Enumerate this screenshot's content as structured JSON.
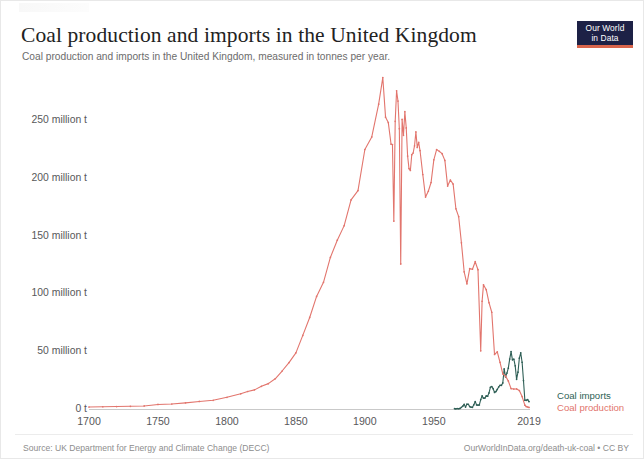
{
  "header": {
    "title": "Coal production and imports in the United Kingdom",
    "subtitle": "Coal production and imports in the United Kingdom, measured in tonnes per year.",
    "logo_line1": "Our World",
    "logo_line2": "in Data"
  },
  "footer": {
    "source": "Source: UK Department for Energy and Climate Change (DECC)",
    "attribution": "OurWorldInData.org/death-uk-coal • CC BY"
  },
  "colors": {
    "production": "#e2756d",
    "imports": "#2f5f56",
    "axis_text": "#58585a",
    "baseline": "#c9c9c9",
    "logo_bg": "#1d2146",
    "logo_rule": "#d9654c"
  },
  "chart_data": {
    "type": "line",
    "title": "Coal production and imports in the United Kingdom",
    "subtitle": "Coal production and imports in the United Kingdom, measured in tonnes per year.",
    "xlabel": "",
    "ylabel": "",
    "xlim": [
      1700,
      2019
    ],
    "ylim": [
      0,
      300000000
    ],
    "grid": false,
    "legend_position": "right",
    "y_ticks": [
      {
        "value": 250000000,
        "label": "250 million t"
      },
      {
        "value": 200000000,
        "label": "200 million t"
      },
      {
        "value": 150000000,
        "label": "150 million t"
      },
      {
        "value": 100000000,
        "label": "100 million t"
      },
      {
        "value": 50000000,
        "label": "50 million t"
      },
      {
        "value": 0,
        "label": "0 t"
      }
    ],
    "x_ticks": [
      {
        "value": 1700,
        "label": "1700"
      },
      {
        "value": 1750,
        "label": "1750"
      },
      {
        "value": 1800,
        "label": "1800"
      },
      {
        "value": 1850,
        "label": "1850"
      },
      {
        "value": 1900,
        "label": "1900"
      },
      {
        "value": 1950,
        "label": "1950"
      },
      {
        "value": 2019,
        "label": "2019"
      }
    ],
    "series": [
      {
        "name": "Coal imports",
        "color": "#2f5f56",
        "legend_label": "Coal imports",
        "x": [
          1965,
          1966,
          1967,
          1968,
          1969,
          1970,
          1971,
          1972,
          1973,
          1974,
          1975,
          1976,
          1977,
          1978,
          1979,
          1980,
          1981,
          1982,
          1983,
          1984,
          1985,
          1986,
          1987,
          1988,
          1989,
          1990,
          1991,
          1992,
          1993,
          1994,
          1995,
          1996,
          1997,
          1998,
          1999,
          2000,
          2001,
          2002,
          2003,
          2004,
          2005,
          2006,
          2007,
          2008,
          2009,
          2010,
          2011,
          2012,
          2013,
          2014,
          2015,
          2016,
          2017,
          2018,
          2019
        ],
        "values": [
          1.2,
          1.0,
          1.3,
          1.1,
          1.4,
          2.3,
          3.3,
          4.8,
          2.5,
          5.0,
          4.9,
          3.0,
          2.4,
          2.3,
          4.5,
          7.3,
          4.4,
          4.2,
          4.4,
          9.0,
          12.2,
          10.2,
          10.3,
          12.2,
          11.9,
          14.8,
          19.6,
          20.3,
          18.4,
          15.2,
          15.9,
          17.8,
          19.9,
          21.3,
          21.3,
          23.4,
          35.5,
          28.7,
          31.9,
          36.2,
          44.0,
          50.5,
          43.4,
          43.9,
          38.2,
          26.5,
          32.7,
          44.8,
          49.4,
          41.3,
          25.5,
          8.5,
          8.4,
          9.0,
          7.3
        ]
      },
      {
        "name": "Coal production",
        "color": "#e2756d",
        "legend_label": "Coal production",
        "x": [
          1700,
          1710,
          1720,
          1730,
          1740,
          1750,
          1760,
          1770,
          1780,
          1790,
          1800,
          1810,
          1815,
          1820,
          1825,
          1830,
          1835,
          1840,
          1845,
          1850,
          1855,
          1860,
          1865,
          1870,
          1875,
          1880,
          1885,
          1890,
          1895,
          1900,
          1905,
          1910,
          1913,
          1915,
          1917,
          1919,
          1920,
          1921,
          1922,
          1923,
          1924,
          1925,
          1926,
          1927,
          1928,
          1929,
          1930,
          1931,
          1932,
          1933,
          1934,
          1935,
          1936,
          1937,
          1938,
          1939,
          1940,
          1942,
          1944,
          1946,
          1948,
          1950,
          1952,
          1954,
          1956,
          1958,
          1960,
          1962,
          1964,
          1966,
          1968,
          1970,
          1972,
          1974,
          1976,
          1978,
          1980,
          1982,
          1984,
          1985,
          1986,
          1988,
          1990,
          1992,
          1994,
          1996,
          1998,
          2000,
          2002,
          2004,
          2006,
          2008,
          2010,
          2012,
          2014,
          2016,
          2017,
          2018,
          2019
        ],
        "values": [
          2.6,
          2.8,
          3.0,
          3.2,
          3.5,
          4.8,
          5.2,
          6.2,
          7.4,
          8.4,
          11.0,
          14.0,
          16.0,
          17.4,
          20.5,
          22.8,
          27.0,
          33.7,
          41.0,
          49.4,
          64.5,
          80.0,
          98.2,
          110.4,
          131.9,
          146.8,
          159.4,
          181.6,
          189.7,
          225.2,
          236.1,
          264.4,
          287.4,
          253.2,
          248.5,
          229.8,
          229.5,
          163.3,
          249.6,
          276.0,
          267.1,
          243.2,
          126.3,
          251.2,
          237.5,
          257.9,
          243.9,
          219.5,
          208.7,
          207.1,
          220.7,
          222.2,
          228.4,
          240.4,
          227.0,
          231.3,
          224.3,
          203.6,
          184.1,
          189.1,
          196.7,
          216.3,
          225.2,
          223.6,
          221.6,
          215.8,
          193.6,
          198.8,
          195.3,
          174.0,
          167.2,
          144.6,
          119.5,
          109.1,
          122.2,
          121.7,
          128.2,
          121.3,
          51.2,
          94.0,
          108.2,
          104.0,
          92.8,
          84.5,
          48.0,
          50.2,
          41.2,
          31.2,
          29.3,
          25.1,
          18.5,
          18.1,
          18.2,
          16.8,
          11.6,
          4.2,
          3.0,
          2.6,
          2.2
        ]
      }
    ]
  }
}
